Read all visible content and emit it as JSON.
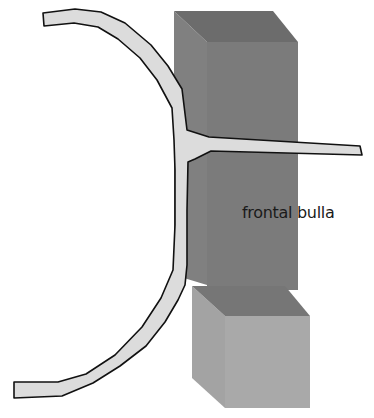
{
  "diagram": {
    "labels": {
      "frontal_bulla": "frontal bulla"
    },
    "shapes": {
      "upper_box": {
        "name": "frontal bulla block",
        "top_color": "#6e6e6e",
        "side_color": "#7e7e7e",
        "front_color": "#7a7a7a"
      },
      "lower_box": {
        "name": "lower block",
        "top_color": "#767676",
        "side_color": "#a4a4a4",
        "front_color": "#a9a9a9"
      },
      "curve": {
        "name": "curved lamella with horizontal branch",
        "fill": "#dcdcdc",
        "stroke": "#111111"
      }
    }
  }
}
